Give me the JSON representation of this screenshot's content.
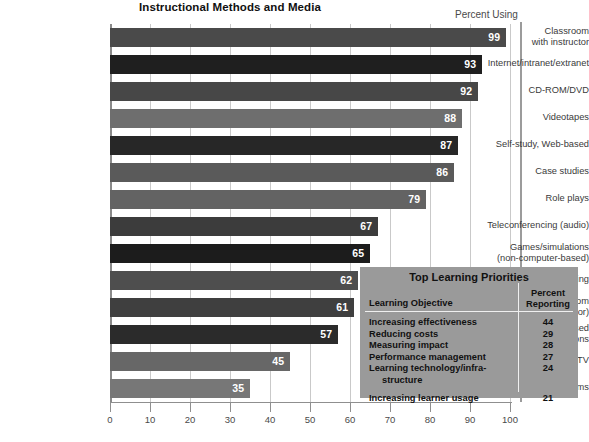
{
  "chart_data": {
    "type": "bar",
    "orientation": "horizontal",
    "title": "Instructional Methods and Media",
    "value_caption": "Percent Using",
    "xlabel": "",
    "ylabel": "",
    "xlim": [
      0,
      100
    ],
    "xticks": [
      0,
      10,
      20,
      30,
      40,
      50,
      60,
      70,
      80,
      90,
      100
    ],
    "grid": true,
    "legend": "none",
    "categories": [
      "Classroom\nwith instructor",
      "Internet/intranet/extranet",
      "CD-ROM/DVD",
      "Videotapes",
      "Self-study, Web-based",
      "Case studies",
      "Role plays",
      "Teleconferencing (audio)",
      "Games/simulations\n(non-computer-based)",
      "Videoconferencing",
      "Virtual classroom\n(with instructor)",
      "Computer-based\ngames/simulations",
      "Satellite/broadcast TV",
      "Experiential programs"
    ],
    "values": [
      99,
      93,
      92,
      88,
      87,
      86,
      79,
      67,
      65,
      62,
      61,
      57,
      45,
      35
    ],
    "bar_colors": [
      "#4a4a4a",
      "#1f1f1f",
      "#474747",
      "#6e6e6e",
      "#272727",
      "#5a5a5a",
      "#636363",
      "#3c3c3c",
      "#1c1c1c",
      "#4e4e4e",
      "#3f3f3f",
      "#2b2b2b",
      "#676767",
      "#777777"
    ]
  },
  "categories_display": [
    {
      "line1": "Classroom",
      "line2": "with instructor"
    },
    {
      "line1": "Internet/intranet/extranet",
      "line2": ""
    },
    {
      "line1": "CD-ROM/DVD",
      "line2": ""
    },
    {
      "line1": "Videotapes",
      "line2": ""
    },
    {
      "line1": "Self-study, Web-based",
      "line2": ""
    },
    {
      "line1": "Case studies",
      "line2": ""
    },
    {
      "line1": "Role plays",
      "line2": ""
    },
    {
      "line1": "Teleconferencing (audio)",
      "line2": ""
    },
    {
      "line1": "Games/simulations",
      "line2": "(non-computer-based)"
    },
    {
      "line1": "Videoconferencing",
      "line2": ""
    },
    {
      "line1": "Virtual classroom",
      "line2": "(with instructor)"
    },
    {
      "line1": "Computer-based",
      "line2": "games/simulations"
    },
    {
      "line1": "Satellite/broadcast TV",
      "line2": ""
    },
    {
      "line1": "Experiential programs",
      "line2": ""
    }
  ],
  "priorities": {
    "title": "Top Learning Priorities",
    "header_objective": "Learning Objective",
    "header_percent_line1": "Percent",
    "header_percent_line2": "Reporting",
    "rows": [
      {
        "label": "Increasing effectiveness",
        "value": "44",
        "indent": false,
        "gap_before": false
      },
      {
        "label": "Reducing costs",
        "value": "29",
        "indent": false,
        "gap_before": false
      },
      {
        "label": "Measuring impact",
        "value": "28",
        "indent": false,
        "gap_before": false
      },
      {
        "label": "Performance management",
        "value": "27",
        "indent": false,
        "gap_before": false
      },
      {
        "label": "Learning technology/infra-",
        "value": "24",
        "indent": false,
        "gap_before": false
      },
      {
        "label": "structure",
        "value": "",
        "indent": true,
        "gap_before": false
      },
      {
        "label": "Increasing learner usage",
        "value": "21",
        "indent": false,
        "gap_before": true
      }
    ],
    "box_color": "#9a9a9a"
  },
  "colors": {
    "background": "#ffffff",
    "gridline": "#c9c9c9",
    "axis": "#8f8f8f",
    "title_text": "#111111",
    "label_text": "#3a3a3a",
    "value_text": "#ffffff"
  }
}
